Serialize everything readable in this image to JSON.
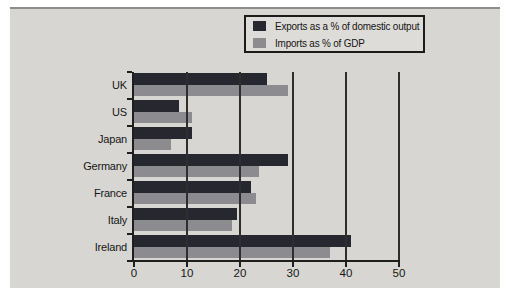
{
  "figure": {
    "background": "#ffffff",
    "panel_bg": "#d7d6d2",
    "legend_bg": "#dedcd8",
    "top_rule_color": "#8d8d8b",
    "axis_color": "#1e1e1e",
    "gridline_color": "#2e2e2e",
    "text_color": "#161616"
  },
  "legend": {
    "entries": [
      {
        "label": "Exports as a % of domestic output",
        "color": "#27272f"
      },
      {
        "label": "Imports as % of GDP",
        "color": "#8c8b90"
      }
    ]
  },
  "chart_data": {
    "type": "bar",
    "orientation": "horizontal",
    "title": "",
    "xlabel": "",
    "ylabel": "",
    "categories": [
      "UK",
      "US",
      "Japan",
      "Germany",
      "France",
      "Italy",
      "Ireland"
    ],
    "series": [
      {
        "name": "Exports as a % of domestic output",
        "color": "#27272f",
        "values": [
          25,
          8.5,
          11,
          29,
          22,
          19.5,
          41
        ]
      },
      {
        "name": "Imports as % of GDP",
        "color": "#8c8b90",
        "values": [
          29,
          11,
          7,
          23.5,
          23,
          18.5,
          37
        ]
      }
    ],
    "xlim": [
      0,
      50
    ],
    "x_ticks": [
      0,
      10,
      20,
      30,
      40,
      50
    ],
    "grid": "vertical-lines-drawn-over-bars",
    "legend_position": "top-right"
  }
}
